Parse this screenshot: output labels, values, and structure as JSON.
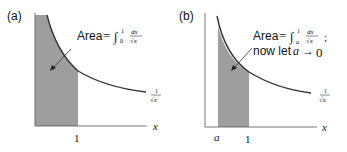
{
  "panels": [
    {
      "id": "a",
      "label": "(a)",
      "annotation": {
        "prefix": "Area",
        "eq": "=",
        "integral": "∫",
        "lower": "0",
        "upper": "1",
        "num": "dx",
        "den": "√x"
      },
      "curve_label": {
        "num": "1",
        "den": "√x"
      },
      "x_axis_label": "x",
      "ticks": [
        "1"
      ]
    },
    {
      "id": "b",
      "label": "(b)",
      "annotation": {
        "prefix": "Area",
        "eq": "=",
        "integral": "∫",
        "lower": "a",
        "upper": "1",
        "num": "dx",
        "den": "√x",
        "suffix": ";",
        "line2_text": "now let",
        "line2_var": "a",
        "line2_arrow": "→",
        "line2_val": "0"
      },
      "curve_label": {
        "num": "1",
        "den": "√x"
      },
      "x_axis_label": "x",
      "ticks": [
        "a",
        "1"
      ]
    }
  ],
  "colors": {
    "shade": "#9e9e9e",
    "line": "#333333"
  }
}
